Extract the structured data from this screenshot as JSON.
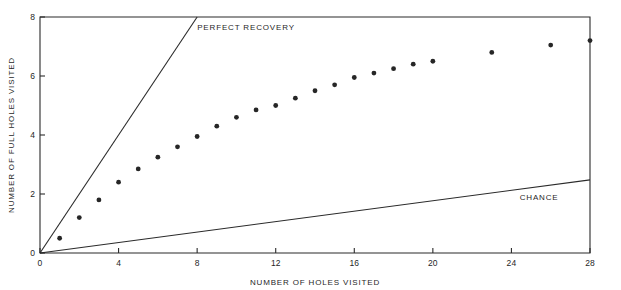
{
  "chart_data": {
    "type": "scatter",
    "title": "",
    "xlabel": "NUMBER OF HOLES VISITED",
    "ylabel": "NUMBER OF FULL HOLES VISITED",
    "xlim": [
      0,
      28
    ],
    "ylim": [
      0,
      8
    ],
    "xticks": [
      0,
      4,
      8,
      12,
      16,
      20,
      24,
      28
    ],
    "yticks": [
      0,
      2,
      4,
      6,
      8
    ],
    "xtick_labels": [
      "0",
      "4",
      "8",
      "12",
      "16",
      "20",
      "24",
      "28"
    ],
    "ytick_labels": [
      "0",
      "2",
      "4",
      "6",
      "8"
    ],
    "grid": false,
    "legend_position": "inline-annotations",
    "series": [
      {
        "name": "observed",
        "kind": "scatter",
        "marker": "filled-circle",
        "color": "#262626",
        "points": [
          {
            "x": 1,
            "y": 0.5
          },
          {
            "x": 2,
            "y": 1.2
          },
          {
            "x": 3,
            "y": 1.8
          },
          {
            "x": 4,
            "y": 2.4
          },
          {
            "x": 5,
            "y": 2.85
          },
          {
            "x": 6,
            "y": 3.25
          },
          {
            "x": 7,
            "y": 3.6
          },
          {
            "x": 8,
            "y": 3.95
          },
          {
            "x": 9,
            "y": 4.3
          },
          {
            "x": 10,
            "y": 4.6
          },
          {
            "x": 11,
            "y": 4.85
          },
          {
            "x": 12,
            "y": 5.0
          },
          {
            "x": 13,
            "y": 5.25
          },
          {
            "x": 14,
            "y": 5.5
          },
          {
            "x": 15,
            "y": 5.7
          },
          {
            "x": 16,
            "y": 5.95
          },
          {
            "x": 17,
            "y": 6.1
          },
          {
            "x": 18,
            "y": 6.25
          },
          {
            "x": 19,
            "y": 6.4
          },
          {
            "x": 20,
            "y": 6.5
          },
          {
            "x": 23,
            "y": 6.8
          },
          {
            "x": 26,
            "y": 7.05
          },
          {
            "x": 28,
            "y": 7.2
          }
        ]
      },
      {
        "name": "PERFECT RECOVERY",
        "kind": "line",
        "color": "#2a2a2a",
        "points": [
          {
            "x": 0,
            "y": 0
          },
          {
            "x": 8,
            "y": 8
          }
        ]
      },
      {
        "name": "CHANCE",
        "kind": "line",
        "color": "#2a2a2a",
        "points": [
          {
            "x": 0,
            "y": 0
          },
          {
            "x": 28,
            "y": 2.48
          }
        ]
      }
    ],
    "annotations": [
      {
        "text": "PERFECT RECOVERY",
        "x": 8.0,
        "y": 7.55,
        "anchor": "start"
      },
      {
        "text": "CHANCE",
        "x": 26.4,
        "y": 1.78,
        "anchor": "end"
      }
    ]
  }
}
